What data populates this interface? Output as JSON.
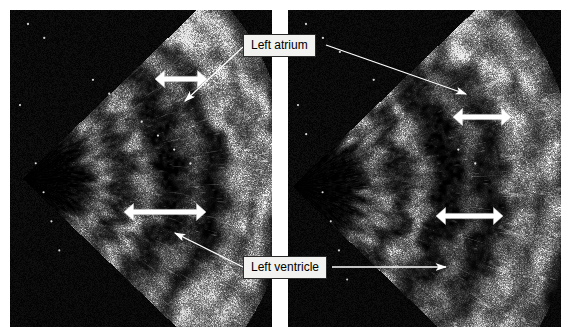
{
  "figure": {
    "width": 571,
    "height": 336,
    "background_color": "#ffffff",
    "type": "medical-ultrasound-echocardiogram",
    "panel_count": 2,
    "gap_color": "#ffffff"
  },
  "panels": [
    {
      "id": "left-panel",
      "name": "left-echo-panel",
      "x": 10,
      "y": 10,
      "width": 262,
      "height": 317,
      "sector": {
        "apex_x": 12,
        "apex_y": 168,
        "half_angle_deg": 44,
        "radius": 268
      },
      "seed": 1317
    },
    {
      "id": "right-panel",
      "name": "right-echo-panel",
      "x": 288,
      "y": 10,
      "width": 273,
      "height": 317,
      "sector": {
        "apex_x": 4,
        "apex_y": 176,
        "half_angle_deg": 44,
        "radius": 284
      },
      "seed": 8821
    }
  ],
  "callouts": [
    {
      "id": "left-atrium",
      "name": "callout-left-atrium",
      "label": "Left atrium",
      "x": 243,
      "y": 34,
      "width": 82,
      "height": 21
    },
    {
      "id": "left-ventricle",
      "name": "callout-left-ventricle",
      "label": "Left ventricle",
      "x": 243,
      "y": 256,
      "width": 88,
      "height": 21
    }
  ],
  "leader_lines": [
    {
      "name": "leader-atrium-to-left-panel",
      "from": [
        243,
        47
      ],
      "to": [
        185,
        101
      ],
      "arrowhead": "end"
    },
    {
      "name": "leader-atrium-to-right-panel",
      "from": [
        326,
        45
      ],
      "to": [
        466,
        94
      ],
      "arrowhead": "end"
    },
    {
      "name": "leader-ventricle-to-left-panel",
      "from": [
        243,
        267
      ],
      "to": [
        175,
        233
      ],
      "arrowhead": "end"
    },
    {
      "name": "leader-ventricle-to-right-panel",
      "from": [
        332,
        267
      ],
      "to": [
        446,
        267
      ],
      "arrowhead": "end"
    }
  ],
  "measure_arrows": [
    {
      "name": "measure-arrow-left-atrium",
      "x1": 155,
      "x2": 207,
      "y": 79,
      "color": "#ffffff",
      "style": "double-headed"
    },
    {
      "name": "measure-arrow-left-ventricle",
      "x1": 124,
      "x2": 206,
      "y": 212,
      "color": "#ffffff",
      "style": "double-headed"
    },
    {
      "name": "measure-arrow-right-atrium",
      "x1": 453,
      "x2": 511,
      "y": 117,
      "color": "#ffffff",
      "style": "double-headed"
    },
    {
      "name": "measure-arrow-right-ventricle",
      "x1": 436,
      "x2": 503,
      "y": 216,
      "color": "#ffffff",
      "style": "double-headed"
    }
  ],
  "colors": {
    "callout_background": "#f2f2f0",
    "callout_border": "#2b2b2b",
    "callout_text": "#000000",
    "annotation_stroke": "#ffffff",
    "panel_background": "#000000"
  }
}
